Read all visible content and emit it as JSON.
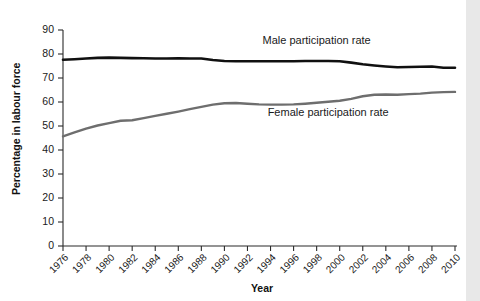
{
  "chart_data": {
    "type": "line",
    "title": "",
    "xlabel": "Year",
    "ylabel": "Percentage in labour force",
    "xlim": [
      1976,
      2010
    ],
    "ylim": [
      0,
      90
    ],
    "grid": false,
    "legend_position": "inline-annotations",
    "x_ticks": [
      1976,
      1978,
      1980,
      1982,
      1984,
      1986,
      1988,
      1990,
      1992,
      1994,
      1996,
      1998,
      2000,
      2002,
      2004,
      2006,
      2008,
      2010
    ],
    "y_ticks": [
      0,
      10,
      20,
      30,
      40,
      50,
      60,
      70,
      80,
      90
    ],
    "x": [
      1976,
      1977,
      1978,
      1979,
      1980,
      1981,
      1982,
      1983,
      1984,
      1985,
      1986,
      1987,
      1988,
      1989,
      1990,
      1991,
      1992,
      1993,
      1994,
      1995,
      1996,
      1997,
      1998,
      1999,
      2000,
      2001,
      2002,
      2003,
      2004,
      2005,
      2006,
      2007,
      2008,
      2009,
      2010
    ],
    "series": [
      {
        "name": "Male participation rate",
        "color": "#101010",
        "label_x": 1998,
        "label_y": 84,
        "values": [
          77.6,
          77.8,
          78.1,
          78.4,
          78.5,
          78.4,
          78.3,
          78.2,
          78.1,
          78.1,
          78.2,
          78.1,
          78.1,
          77.5,
          77.1,
          77.0,
          77.0,
          77.0,
          77.0,
          77.0,
          77.0,
          77.1,
          77.1,
          77.1,
          77.0,
          76.4,
          75.7,
          75.2,
          74.8,
          74.5,
          74.6,
          74.7,
          74.8,
          74.3,
          74.3
        ]
      },
      {
        "name": "Female participation rate",
        "color": "#6e6e6e",
        "label_x": 1999,
        "label_y": 54,
        "values": [
          45.7,
          47.3,
          48.9,
          50.2,
          51.2,
          52.2,
          52.4,
          53.3,
          54.2,
          55.1,
          56.0,
          57.0,
          58.0,
          58.9,
          59.5,
          59.6,
          59.3,
          59.0,
          58.9,
          58.9,
          59.0,
          59.3,
          59.7,
          60.1,
          60.5,
          61.3,
          62.4,
          63.0,
          63.1,
          63.0,
          63.3,
          63.5,
          63.9,
          64.1,
          64.2
        ]
      }
    ]
  }
}
